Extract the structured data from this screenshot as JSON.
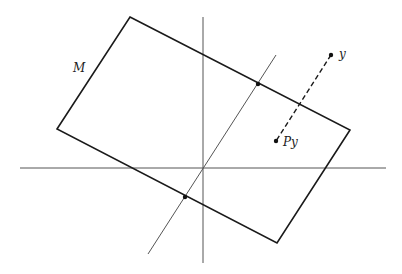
{
  "diagram": {
    "labels": {
      "plane": "M",
      "point_y": "y",
      "projection": "Py"
    },
    "colors": {
      "background": "#ffffff",
      "thick_line": "#1a1a1a",
      "thin_line": "#555555"
    },
    "plane_corners": [
      [
        130,
        17
      ],
      [
        350,
        130
      ],
      [
        277,
        243
      ],
      [
        57,
        129
      ]
    ],
    "axes": {
      "horizontal": {
        "x1": 20,
        "y1": 168,
        "x2": 386,
        "y2": 168
      },
      "vertical": {
        "x1": 203,
        "y1": 17,
        "x2": 203,
        "y2": 263
      }
    },
    "oblique_line": {
      "x1": 276,
      "y1": 55,
      "x2": 148,
      "y2": 254
    },
    "projection_segment": {
      "from": [
        331,
        55
      ],
      "to": [
        276,
        141
      ],
      "style": "dashed"
    },
    "points": [
      {
        "name": "y",
        "x": 331,
        "y": 55
      },
      {
        "name": "Py",
        "x": 276,
        "y": 141
      },
      {
        "name": "upper-intersection",
        "x": 258,
        "y": 84
      },
      {
        "name": "lower-intersection",
        "x": 185,
        "y": 197
      }
    ]
  }
}
